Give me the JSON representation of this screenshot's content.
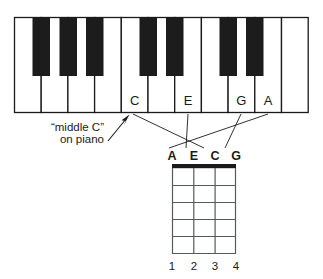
{
  "figure": {
    "type": "music-notation-diagram",
    "ink_color": "#1a1a1a",
    "white_key_color": "#ffffff",
    "black_key_color": "#1c1c1c",
    "background": "#ffffff"
  },
  "keyboard": {
    "white_key_count": 11,
    "black_key_count": 7,
    "black_key_pattern": [
      1,
      2,
      3,
      5,
      6,
      8,
      9
    ],
    "labels": [
      {
        "note": "C",
        "white_key_index": 5
      },
      {
        "note": "E",
        "white_key_index": 7
      },
      {
        "note": "G",
        "white_key_index": 9
      },
      {
        "note": "A",
        "white_key_index": 10
      }
    ]
  },
  "annotation": {
    "line1": "“middle C”",
    "line2": "on piano",
    "points_to": "C"
  },
  "chord_diagram": {
    "string_labels": [
      "A",
      "E",
      "C",
      "G"
    ],
    "string_count": 4,
    "fret_count": 5,
    "fret_numbers": [
      "1",
      "2",
      "3",
      "4"
    ],
    "nut": true,
    "fingering": []
  },
  "leader_lines": [
    {
      "from": "C",
      "to": "C"
    },
    {
      "from": "E",
      "to": "E"
    },
    {
      "from": "G",
      "to": "G"
    },
    {
      "from": "A",
      "to": "A"
    }
  ]
}
